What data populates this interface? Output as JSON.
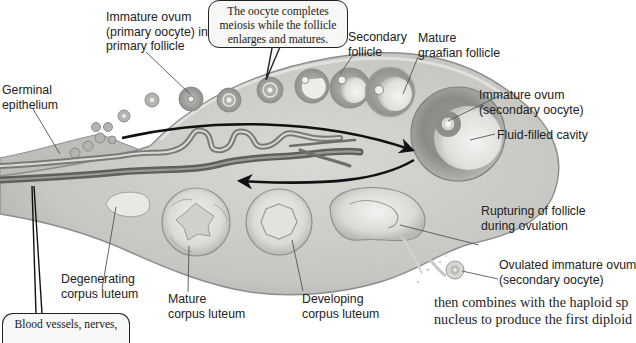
{
  "diagram": {
    "style": "grayscale anatomical illustration",
    "colors": {
      "background": "#ffffff",
      "ovary_fill": "#c9c9c6",
      "ovary_edge": "#8d8d8a",
      "follicle_ring": "#9a9a96",
      "corpus_luteum": "#e2e2df",
      "vessel_dark": "#6e6e6b",
      "arrow": "#111111",
      "label_text": "#222222",
      "callout_border": "#222222",
      "callout_fill": "#f7f7f5"
    },
    "labels": {
      "immature_ovum_primary": [
        "Immature ovum",
        "(primary oocyte) in",
        "primary follicle"
      ],
      "secondary_follicle": [
        "Secondary",
        "follicle"
      ],
      "mature_graafian": [
        "Mature",
        "graafian follicle"
      ],
      "germinal_epithelium": [
        "Germinal",
        "epithelium"
      ],
      "immature_ovum_secondary": [
        "Immature ovum",
        "(secondary oocyte)"
      ],
      "fluid_filled_cavity": [
        "Fluid-filled cavity"
      ],
      "rupturing_follicle": [
        "Rupturing of follicle",
        "during ovulation"
      ],
      "ovulated_ovum": [
        "Ovulated immature ovum",
        "(secondary oocyte)"
      ],
      "degenerating_cl": [
        "Degenerating",
        "corpus luteum"
      ],
      "mature_cl": [
        "Mature",
        "corpus luteum"
      ],
      "developing_cl": [
        "Developing",
        "corpus luteum"
      ]
    },
    "callouts": {
      "meiosis": [
        "The oocyte completes",
        "meiosis while the follicle",
        "enlarges and matures."
      ],
      "blood_vessels": [
        "Blood vessels, nerves,"
      ]
    },
    "body_text": [
      "then combines with the haploid sp",
      "nucleus to produce the first diploid"
    ],
    "arrows": [
      {
        "name": "maturation-arrow",
        "direction": "left-to-right",
        "meaning": "follicle maturation sequence"
      },
      {
        "name": "regression-arrow",
        "direction": "right-to-left",
        "meaning": "corpus luteum sequence"
      }
    ]
  }
}
